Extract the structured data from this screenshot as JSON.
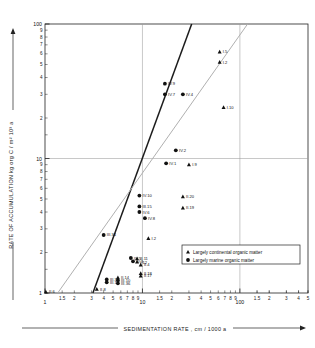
{
  "chart_data": {
    "type": "scatter",
    "title": "",
    "xlabel": "SEDIMENTATION RATE , cm / 1000 a",
    "ylabel": "RATE OF ACCUMULATION ( kg org C / m² 10³ a )",
    "xscale": "log",
    "yscale": "log",
    "xlim": [
      1,
      500
    ],
    "ylim": [
      1,
      100
    ],
    "grid": true,
    "gridlines_x": [
      10,
      100
    ],
    "gridlines_y": [
      10
    ],
    "xticks_major": [
      "1",
      "10",
      "100"
    ],
    "xticks_minor": [
      "1.5",
      "2",
      "3",
      "4",
      "5",
      "6",
      "7",
      "8",
      "9",
      "1.5",
      "2",
      "3",
      "4",
      "5",
      "6",
      "7",
      "8",
      "9",
      "1.5",
      "2",
      "3",
      "4",
      "5"
    ],
    "yticks_major": [
      "1",
      "10",
      "100"
    ],
    "yticks_minor": [
      "2",
      "3",
      "4",
      "5",
      "6",
      "7",
      "8",
      "9"
    ],
    "legend": {
      "position": "bottom-right",
      "entries": [
        {
          "marker": "triangle",
          "label": "Largely continental organic matter"
        },
        {
          "marker": "circle",
          "label": "Largely marine organic matter"
        }
      ]
    },
    "trendlines": [
      {
        "name": "heavy-regression-line",
        "color": "#1c1c1c",
        "width": 1.5,
        "x": [
          3.1,
          32
        ],
        "y": [
          1.0,
          100
        ]
      },
      {
        "name": "light-regression-line",
        "color": "#b0b0b0",
        "width": 1.0,
        "x": [
          1.35,
          120
        ],
        "y": [
          1.0,
          100
        ]
      }
    ],
    "series": [
      {
        "name": "Largely marine organic matter",
        "marker": "circle",
        "points": [
          {
            "label": "IV.9",
            "x": 17.0,
            "y": 36.0
          },
          {
            "label": "IV.7",
            "x": 17.0,
            "y": 30.0
          },
          {
            "label": "IV.4",
            "x": 26.0,
            "y": 30.0
          },
          {
            "label": "IV.2",
            "x": 22.0,
            "y": 11.5
          },
          {
            "label": "IV.1",
            "x": 17.5,
            "y": 9.2
          },
          {
            "label": "IV.10",
            "x": 9.3,
            "y": 5.3
          },
          {
            "label": "III.15",
            "x": 9.3,
            "y": 4.4
          },
          {
            "label": "IV.6",
            "x": 9.3,
            "y": 4.0
          },
          {
            "label": "IV.8",
            "x": 10.6,
            "y": 3.6
          },
          {
            "label": "III.34",
            "x": 4.0,
            "y": 2.7
          },
          {
            "label": "IV.5",
            "x": 7.6,
            "y": 1.82
          },
          {
            "label": "IV.3",
            "x": 8.0,
            "y": 1.72
          },
          {
            "label": "III.30",
            "x": 4.3,
            "y": 1.26
          },
          {
            "label": "III.17",
            "x": 4.3,
            "y": 1.2
          },
          {
            "label": "III.10",
            "x": 5.6,
            "y": 1.24
          },
          {
            "label": "III.36",
            "x": 5.6,
            "y": 1.18
          }
        ]
      },
      {
        "name": "Largely continental organic matter",
        "marker": "triangle",
        "points": [
          {
            "label": "I.5",
            "x": 62.0,
            "y": 62.0
          },
          {
            "label": "I.2",
            "x": 62.0,
            "y": 52.0
          },
          {
            "label": "I.10",
            "x": 68.0,
            "y": 24.0
          },
          {
            "label": "I.9",
            "x": 30.0,
            "y": 9.0
          },
          {
            "label": "II.20",
            "x": 26.0,
            "y": 5.2
          },
          {
            "label": "II.19",
            "x": 26.0,
            "y": 4.3
          },
          {
            "label": "I.2b",
            "x": 11.5,
            "y": 2.55
          },
          {
            "label": "II.11",
            "x": 8.8,
            "y": 1.8
          },
          {
            "label": "I.12",
            "x": 8.8,
            "y": 1.7
          },
          {
            "label": "II.4",
            "x": 9.6,
            "y": 1.62
          },
          {
            "label": "II.18",
            "x": 9.6,
            "y": 1.4
          },
          {
            "label": "II.17",
            "x": 9.6,
            "y": 1.34
          },
          {
            "label": "II.14",
            "x": 5.6,
            "y": 1.3
          },
          {
            "label": "II.8",
            "x": 3.4,
            "y": 1.07
          },
          {
            "label": "II.6",
            "x": 1.02,
            "y": 1.02
          }
        ]
      }
    ]
  }
}
